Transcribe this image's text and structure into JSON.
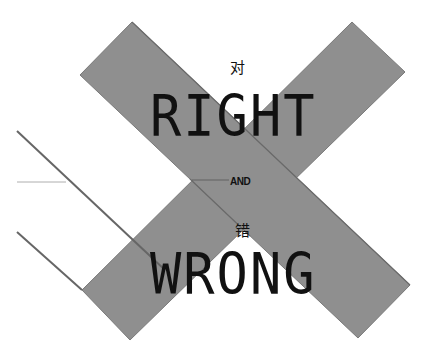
{
  "poster": {
    "top_chinese": "对",
    "top_word": "RIGHT",
    "middle_word": "AND",
    "bottom_chinese": "错",
    "bottom_word": "WRONG"
  },
  "colors": {
    "background": "#ffffff",
    "band_fill": "#8f8f8f",
    "band_outline": "#6a6a6a",
    "text": "#111111",
    "thin_line": "#9a9a9a"
  },
  "shapes": {
    "band_descending": [
      [
        80,
        75
      ],
      [
        132,
        22
      ],
      [
        410,
        285
      ],
      [
        358,
        338
      ]
    ],
    "band_ascending": [
      [
        352,
        22
      ],
      [
        405,
        72
      ],
      [
        130,
        340
      ],
      [
        82,
        290
      ]
    ]
  }
}
